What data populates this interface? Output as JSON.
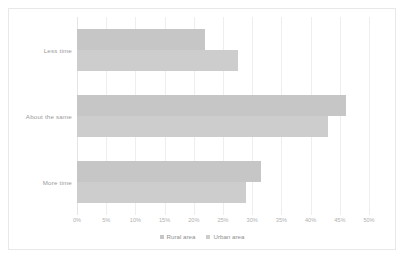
{
  "chart_data": {
    "type": "bar",
    "orientation": "horizontal",
    "title": "",
    "xlabel": "",
    "ylabel": "",
    "categories": [
      "Less time",
      "About the same",
      "More time"
    ],
    "series": [
      {
        "name": "Rural area",
        "color": "#c6c6c6",
        "values": [
          22,
          46,
          31.5
        ]
      },
      {
        "name": "Urban area",
        "color": "#cdcdcd",
        "values": [
          27.5,
          43,
          29
        ]
      }
    ],
    "xlim": [
      0,
      50
    ],
    "xtick_values": [
      0,
      5,
      10,
      15,
      20,
      25,
      30,
      35,
      40,
      45,
      50
    ],
    "xtick_labels": [
      "0%",
      "5%",
      "10%",
      "15%",
      "20%",
      "25%",
      "30%",
      "35%",
      "40%",
      "45%",
      "50%"
    ],
    "grid": "vertical",
    "legend_position": "bottom",
    "legend": [
      "Rural area",
      "Urban area"
    ],
    "border_color": "#e8e8e8",
    "gridline_color": "#eeeeee",
    "label_color": "#9a9a9a",
    "background": "#ffffff"
  }
}
